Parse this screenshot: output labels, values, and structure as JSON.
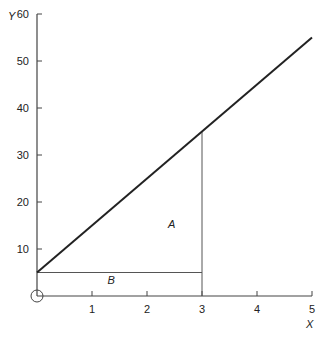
{
  "chart_data": {
    "type": "line",
    "title": "",
    "xlabel": "X",
    "ylabel": "Y",
    "xlim": [
      0,
      5
    ],
    "ylim": [
      0,
      60
    ],
    "x_ticks": [
      1,
      2,
      3,
      4,
      5
    ],
    "y_ticks": [
      10,
      20,
      30,
      40,
      50,
      60
    ],
    "grid": false,
    "legend": null,
    "series": [
      {
        "name": "line",
        "x": [
          0,
          5
        ],
        "y": [
          5,
          55
        ]
      }
    ],
    "annotations": [
      {
        "type": "vline",
        "x": 3,
        "y_from": 0,
        "y_to": 35
      },
      {
        "type": "hline",
        "y": 5,
        "x_from": 0,
        "x_to": 3
      },
      {
        "type": "text",
        "label": "A",
        "x": 2.45,
        "y": 14.5
      },
      {
        "type": "text",
        "label": "B",
        "x": 1.35,
        "y": 2.5
      },
      {
        "type": "origin-circle",
        "x": 0,
        "y": 0
      }
    ]
  },
  "labels": {
    "x_axis": "X",
    "y_axis": "Y",
    "region_a": "A",
    "region_b": "B"
  },
  "colors": {
    "line": "#222222",
    "axis": "#444444",
    "guide": "#555555"
  }
}
